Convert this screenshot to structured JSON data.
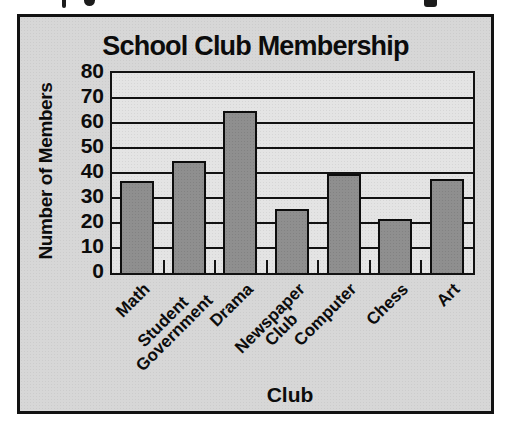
{
  "chart_data": {
    "type": "bar",
    "title": "School Club Membership",
    "xlabel": "Club",
    "ylabel": "Number of Members",
    "categories": [
      "Math",
      "Student Government",
      "Drama",
      "Newspaper Club",
      "Computer",
      "Chess",
      "Art"
    ],
    "category_display": [
      [
        "Math"
      ],
      [
        "Student",
        "Government"
      ],
      [
        "Drama"
      ],
      [
        "Newspaper",
        "Club"
      ],
      [
        "Computer"
      ],
      [
        "Chess"
      ],
      [
        "Art"
      ]
    ],
    "values": [
      37,
      45,
      65,
      26,
      40,
      22,
      38
    ],
    "ylim": [
      0,
      80
    ],
    "yticks": [
      0,
      10,
      20,
      30,
      40,
      50,
      60,
      70,
      80
    ],
    "grid": "horizontal",
    "legend": "none",
    "bar_color": "#8f8f8f",
    "bar_border_color": "#0d0d0d",
    "plot_background": "#e4e4e4",
    "figure_background": "#d7d7d7",
    "frame_border_color": "#121212"
  }
}
